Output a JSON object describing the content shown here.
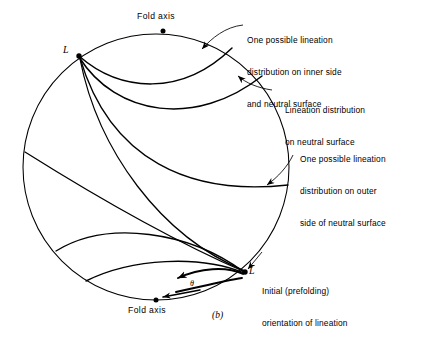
{
  "figure": {
    "caption": "(b)",
    "type": "stereonet-lineation-diagram"
  },
  "axis_labels": {
    "top": "Fold axis",
    "bottom": "Fold axis"
  },
  "node_labels": {
    "upper_left": "L",
    "lower_right": "L"
  },
  "angle_label": "θ",
  "annotations": [
    {
      "id": "inner-side",
      "lines": [
        "One possible lineation",
        "distribution on inner side",
        "and neutral surface"
      ]
    },
    {
      "id": "neutral-surface",
      "lines": [
        "Lineation distribution",
        "on neutral surface"
      ]
    },
    {
      "id": "outer-side",
      "lines": [
        "One possible lineation",
        "distribution on outer",
        "side of neutral surface"
      ]
    },
    {
      "id": "initial-orientation",
      "lines": [
        "Initial (prefolding)",
        "orientation of lineation"
      ]
    }
  ],
  "colors": {
    "ink": "#000000",
    "background": "#ffffff"
  },
  "geometry": {
    "circle_center_x": 156,
    "circle_center_y": 167,
    "circle_radius": 133
  }
}
